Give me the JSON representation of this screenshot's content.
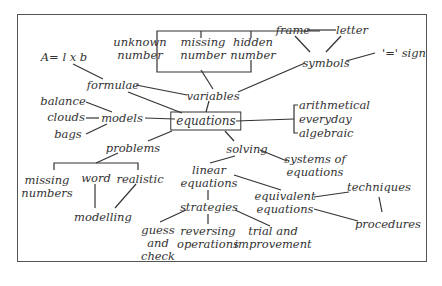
{
  "diagram": {
    "type": "concept-map",
    "central": "equations",
    "nodes": {
      "unknown_number": "unknown number",
      "missing_number": "missing number",
      "hidden_number": "hidden number",
      "frame": "frame",
      "letter": "letter",
      "symbols": "symbols",
      "equals_sign": "'=' sign",
      "area_formula": "A= l x b",
      "formulae": "formulae",
      "variables": "variables",
      "balance": "balance",
      "clouds": "clouds",
      "bags": "bags",
      "models": "models",
      "equations": "equations",
      "arithmetical": "arithmetical",
      "everyday": "everyday",
      "algebraic": "algebraic",
      "problems": "problems",
      "solving": "solving",
      "systems_of_equations": "systems of equations",
      "missing_numbers": "missing numbers",
      "word": "word",
      "realistic": "realistic",
      "modelling": "modelling",
      "linear_equations": "linear equations",
      "equivalent_equations": "equivalent equations",
      "techniques": "techniques",
      "procedures": "procedures",
      "strategies": "strategies",
      "guess_and_check": "guess and check",
      "reversing_operations": "reversing operations",
      "trial_and_improvement": "trial and improvement"
    },
    "labels": {
      "unknown_1": "unknown",
      "unknown_2": "number",
      "missing_1": "missing",
      "missing_2": "number",
      "hidden_1": "hidden",
      "hidden_2": "number",
      "systems_1": "systems of",
      "systems_2": "equations",
      "missing_numbers_1": "missing",
      "missing_numbers_2": "numbers",
      "linear_1": "linear",
      "linear_2": "equations",
      "equivalent_1": "equivalent",
      "equivalent_2": "equations",
      "guess_1": "guess",
      "guess_2": "and",
      "guess_3": "check",
      "reversing_1": "reversing",
      "reversing_2": "operations",
      "trial_1": "trial and",
      "trial_2": "improvement"
    }
  }
}
